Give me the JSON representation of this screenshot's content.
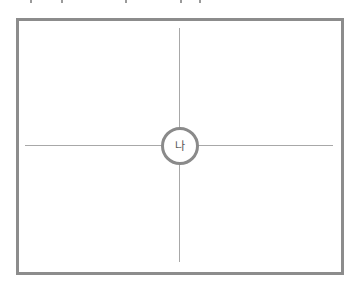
{
  "diagram": {
    "center_label": "나",
    "colors": {
      "frame": "#8c8c8c",
      "axis_lines": "#a8a8a8",
      "circle_border": "#8a8a8a",
      "label": "#555555",
      "background": "#ffffff"
    }
  }
}
